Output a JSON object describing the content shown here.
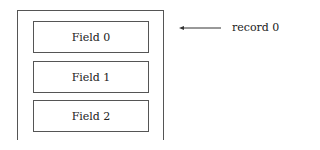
{
  "diagram": {
    "record_label": "record 0",
    "fields": [
      {
        "label": "Field 0"
      },
      {
        "label": "Field 1"
      },
      {
        "label": "Field 2"
      }
    ],
    "colors": {
      "stroke": "#555555",
      "text": "#222222",
      "background": "#ffffff"
    }
  }
}
